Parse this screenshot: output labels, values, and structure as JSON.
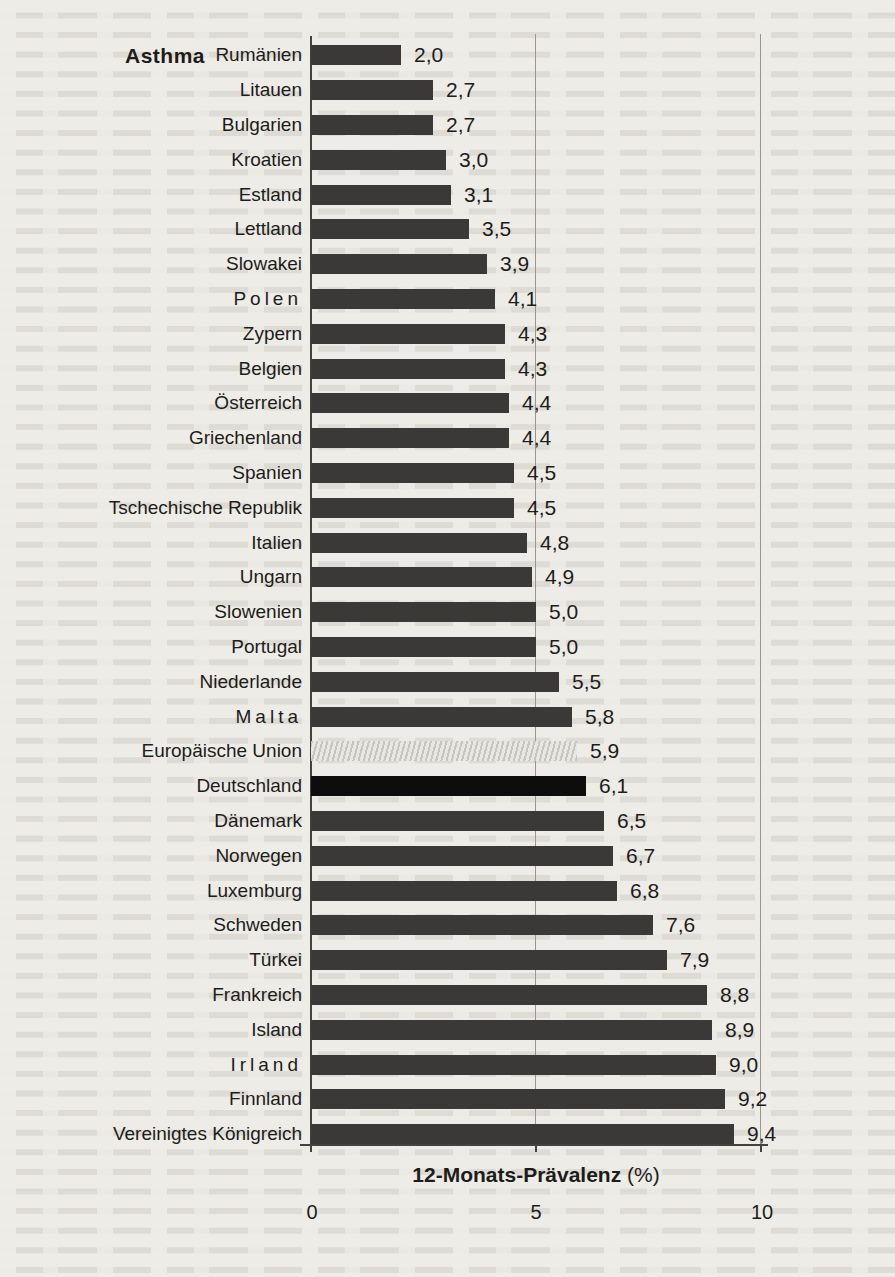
{
  "chart_data": {
    "type": "bar",
    "orientation": "horizontal",
    "title": "Asthma",
    "xlabel": "12-Monats-Prävalenz",
    "xlabel_unit": "(%)",
    "xlim": [
      0,
      10.5
    ],
    "xticks": [
      "0",
      "5",
      "10"
    ],
    "xtick_values": [
      0,
      5,
      10
    ],
    "grid": "vertical gridlines at 5 and 10",
    "value_decimal_separator": ",",
    "legend": "none",
    "rows": [
      {
        "label": "Rumänien",
        "value": 2.0,
        "display": "2,0"
      },
      {
        "label": "Litauen",
        "value": 2.7,
        "display": "2,7"
      },
      {
        "label": "Bulgarien",
        "value": 2.7,
        "display": "2,7"
      },
      {
        "label": "Kroatien",
        "value": 3.0,
        "display": "3,0"
      },
      {
        "label": "Estland",
        "value": 3.1,
        "display": "3,1"
      },
      {
        "label": "Lettland",
        "value": 3.5,
        "display": "3,5"
      },
      {
        "label": "Slowakei",
        "value": 3.9,
        "display": "3,9"
      },
      {
        "label": "Polen",
        "value": 4.1,
        "display": "4,1",
        "letter_spaced": true
      },
      {
        "label": "Zypern",
        "value": 4.3,
        "display": "4,3"
      },
      {
        "label": "Belgien",
        "value": 4.3,
        "display": "4,3"
      },
      {
        "label": "Österreich",
        "value": 4.4,
        "display": "4,4"
      },
      {
        "label": "Griechenland",
        "value": 4.4,
        "display": "4,4"
      },
      {
        "label": "Spanien",
        "value": 4.5,
        "display": "4,5"
      },
      {
        "label": "Tschechische Republik",
        "value": 4.5,
        "display": "4,5"
      },
      {
        "label": "Italien",
        "value": 4.8,
        "display": "4,8"
      },
      {
        "label": "Ungarn",
        "value": 4.9,
        "display": "4,9"
      },
      {
        "label": "Slowenien",
        "value": 5.0,
        "display": "5,0"
      },
      {
        "label": "Portugal",
        "value": 5.0,
        "display": "5,0"
      },
      {
        "label": "Niederlande",
        "value": 5.5,
        "display": "5,5"
      },
      {
        "label": "Malta",
        "value": 5.8,
        "display": "5,8",
        "letter_spaced": true
      },
      {
        "label": "Europäische Union",
        "value": 5.9,
        "display": "5,9",
        "style": "eu-hatched"
      },
      {
        "label": "Deutschland",
        "value": 6.1,
        "display": "6,1",
        "style": "highlight-black"
      },
      {
        "label": "Dänemark",
        "value": 6.5,
        "display": "6,5"
      },
      {
        "label": "Norwegen",
        "value": 6.7,
        "display": "6,7"
      },
      {
        "label": "Luxemburg",
        "value": 6.8,
        "display": "6,8"
      },
      {
        "label": "Schweden",
        "value": 7.6,
        "display": "7,6"
      },
      {
        "label": "Türkei",
        "value": 7.9,
        "display": "7,9"
      },
      {
        "label": "Frankreich",
        "value": 8.8,
        "display": "8,8"
      },
      {
        "label": "Island",
        "value": 8.9,
        "display": "8,9"
      },
      {
        "label": "Irland",
        "value": 9.0,
        "display": "9,0",
        "letter_spaced": true
      },
      {
        "label": "Finnland",
        "value": 9.2,
        "display": "9,2"
      },
      {
        "label": "Vereinigtes Königreich",
        "value": 9.4,
        "display": "9,4"
      }
    ],
    "colors": {
      "bar_default": "#3a3938",
      "bar_highlight_black": "#0d0d0d",
      "bar_eu_base": "#e9e7e2",
      "bar_eu_stripe": "#c7c5bf",
      "gridline": "#9a968e",
      "axis": "#45423d",
      "text": "#1d1c1a",
      "paper": "#eeece7"
    }
  }
}
